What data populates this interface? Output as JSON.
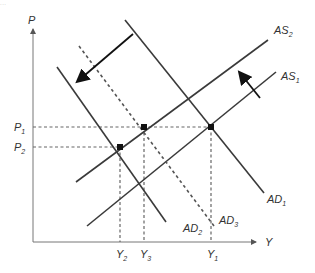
{
  "header": {
    "text": "..."
  },
  "diagram": {
    "type": "AD-AS shift",
    "axes": {
      "y_label": "P",
      "x_label": "Y"
    },
    "price_levels": [
      {
        "label": "P",
        "sub": "1"
      },
      {
        "label": "P",
        "sub": "2"
      }
    ],
    "output_levels": [
      {
        "label": "Y",
        "sub": "2"
      },
      {
        "label": "Y",
        "sub": "3"
      },
      {
        "label": "Y",
        "sub": "1"
      }
    ],
    "curves": [
      {
        "name": "AS",
        "sub": "2",
        "style": "solid"
      },
      {
        "name": "AS",
        "sub": "1",
        "style": "solid"
      },
      {
        "name": "AD",
        "sub": "1",
        "style": "solid"
      },
      {
        "name": "AD",
        "sub": "2",
        "style": "solid"
      },
      {
        "name": "AD",
        "sub": "3",
        "style": "dashed"
      }
    ],
    "colors": {
      "line": "#3a3a3a",
      "dashed": "#666666",
      "arrow": "#111111"
    }
  }
}
